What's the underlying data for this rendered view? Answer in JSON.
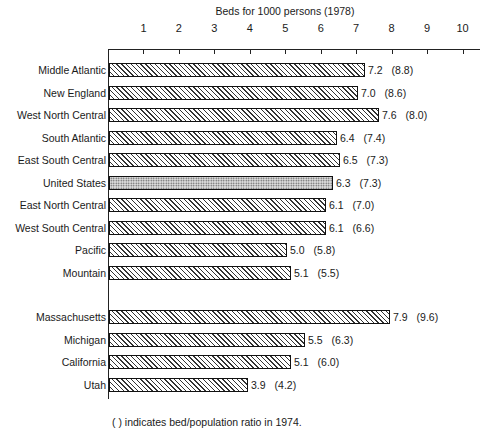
{
  "chart_data": {
    "type": "bar",
    "orientation": "horizontal",
    "title": "Beds for 1000 persons (1978)",
    "xlabel": "Beds for 1000 persons (1978)",
    "ylabel": "",
    "xlim": [
      0,
      10
    ],
    "x_ticks": [
      "1",
      "2",
      "3",
      "4",
      "5",
      "6",
      "7",
      "8",
      "9",
      "10"
    ],
    "grid": false,
    "legend": null,
    "footnote": "(   ) indicates bed/population ratio in 1974.",
    "categories": [
      "Middle Atlantic",
      "New England",
      "West North Central",
      "South Atlantic",
      "East South Central",
      "United States",
      "East North Central",
      "West South Central",
      "Pacific",
      "Mountain",
      "Massachusetts",
      "Michigan",
      "California",
      "Utah"
    ],
    "series": [
      {
        "name": "1978",
        "values": [
          7.2,
          7.0,
          7.6,
          6.4,
          6.5,
          6.3,
          6.1,
          6.1,
          5.0,
          5.1,
          7.9,
          5.5,
          5.1,
          3.9
        ]
      },
      {
        "name": "1974",
        "values": [
          8.8,
          8.6,
          8.0,
          7.4,
          7.3,
          7.3,
          7.0,
          6.6,
          5.8,
          5.5,
          9.6,
          6.3,
          6.0,
          4.2
        ]
      }
    ],
    "bars": [
      {
        "label": "Middle Atlantic",
        "value": 7.2,
        "value_text": "7.2",
        "prior_text": "(8.8)",
        "pattern": "hatch"
      },
      {
        "label": "New England",
        "value": 7.0,
        "value_text": "7.0",
        "prior_text": "(8.6)",
        "pattern": "hatch"
      },
      {
        "label": "West North Central",
        "value": 7.6,
        "value_text": "7.6",
        "prior_text": "(8.0)",
        "pattern": "hatch"
      },
      {
        "label": "South Atlantic",
        "value": 6.4,
        "value_text": "6.4",
        "prior_text": "(7.4)",
        "pattern": "hatch"
      },
      {
        "label": "East South Central",
        "value": 6.5,
        "value_text": "6.5",
        "prior_text": "(7.3)",
        "pattern": "hatch"
      },
      {
        "label": "United States",
        "value": 6.3,
        "value_text": "6.3",
        "prior_text": "(7.3)",
        "pattern": "stipple"
      },
      {
        "label": "East North Central",
        "value": 6.1,
        "value_text": "6.1",
        "prior_text": "(7.0)",
        "pattern": "hatch"
      },
      {
        "label": "West South Central",
        "value": 6.1,
        "value_text": "6.1",
        "prior_text": "(6.6)",
        "pattern": "hatch"
      },
      {
        "label": "Pacific",
        "value": 5.0,
        "value_text": "5.0",
        "prior_text": "(5.8)",
        "pattern": "hatch"
      },
      {
        "label": "Mountain",
        "value": 5.1,
        "value_text": "5.1",
        "prior_text": "(5.5)",
        "pattern": "hatch"
      },
      {
        "label": "Massachusetts",
        "value": 7.9,
        "value_text": "7.9",
        "prior_text": "(9.6)",
        "pattern": "hatch"
      },
      {
        "label": "Michigan",
        "value": 5.5,
        "value_text": "5.5",
        "prior_text": "(6.3)",
        "pattern": "hatch"
      },
      {
        "label": "California",
        "value": 5.1,
        "value_text": "5.1",
        "prior_text": "(6.0)",
        "pattern": "hatch"
      },
      {
        "label": "Utah",
        "value": 3.9,
        "value_text": "3.9",
        "prior_text": "(4.2)",
        "pattern": "hatch"
      }
    ]
  },
  "layout": {
    "row_tops": [
      63,
      86,
      108,
      131,
      153,
      176,
      198,
      221,
      243,
      266,
      310,
      333,
      355,
      378
    ]
  }
}
